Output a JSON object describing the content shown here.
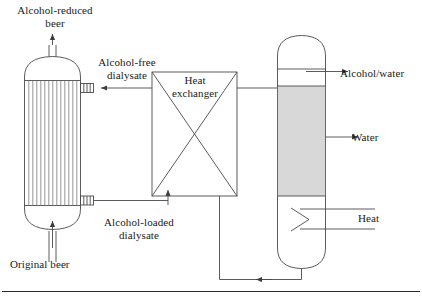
{
  "figure": {
    "width": 422,
    "height": 298,
    "background": "#ffffff",
    "line_color": "#4a4a4a",
    "text_color": "#1a1a1a",
    "packing_fill": "#d8d8d8"
  },
  "labels": {
    "alcohol_reduced_beer": "Alcohol-reduced\nbeer",
    "alcohol_free_dialysate": "Alcohol-free\ndialysate",
    "heat_exchanger": "Heat\nexchanger",
    "alcohol_water": "Alcohol/water",
    "water": "Water",
    "heat": "Heat",
    "alcohol_loaded_dialysate": "Alcohol-loaded\ndialysate",
    "original_beer": "Original beer"
  },
  "equipment": [
    {
      "id": "dialyzer",
      "name": "hollow-fiber-dialyzer",
      "shape": "vertical vessel with domed top and bottom and internal vertical hollow fibers",
      "fiber_count": 13
    },
    {
      "id": "heat-exchanger",
      "name": "heat-exchanger",
      "shape": "rectangle with crossed diagonals"
    },
    {
      "id": "distillation-column",
      "name": "distillation-column",
      "shape": "vertical column with domed top, packed gray section, reboiler chevron and domed bottom"
    }
  ],
  "streams": [
    {
      "id": "alcohol-reduced-beer",
      "from": "dialyzer-top",
      "to": "outlet",
      "direction": "up"
    },
    {
      "id": "original-beer",
      "from": "inlet",
      "to": "dialyzer-bottom",
      "direction": "up"
    },
    {
      "id": "alcohol-free-dialysate",
      "from": "heat-exchanger",
      "to": "dialyzer-top-nozzle",
      "direction": "left"
    },
    {
      "id": "alcohol-loaded-dialysate",
      "from": "dialyzer-bottom-nozzle",
      "to": "heat-exchanger",
      "direction": "right"
    },
    {
      "id": "column-feed",
      "from": "heat-exchanger",
      "to": "column-middle",
      "direction": "right"
    },
    {
      "id": "alcohol-water-vapor",
      "from": "column-top",
      "to": "outlet",
      "direction": "right"
    },
    {
      "id": "water-sidedraw",
      "from": "column",
      "to": "outlet",
      "direction": "right"
    },
    {
      "id": "heat-input",
      "from": "inlet",
      "to": "column-reboiler",
      "direction": "left"
    },
    {
      "id": "bottoms-recycle",
      "from": "column-bottom",
      "to": "heat-exchanger-bottom",
      "direction": "left"
    }
  ]
}
